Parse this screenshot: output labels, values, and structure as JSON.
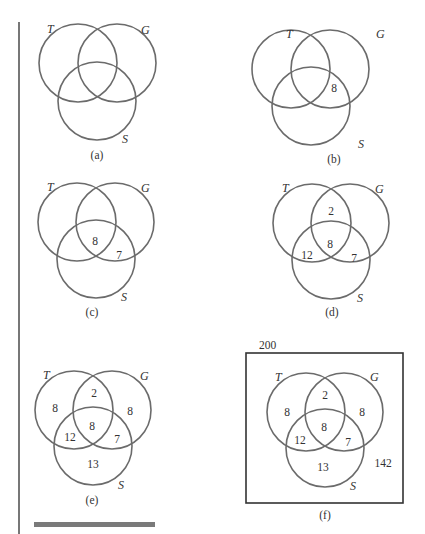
{
  "sets": {
    "T": "T",
    "G": "G",
    "S": "S"
  },
  "panels": [
    {
      "id": "a",
      "caption": "(a)",
      "regions": {}
    },
    {
      "id": "b",
      "caption": "(b)",
      "regions": {
        "TGS": "8"
      }
    },
    {
      "id": "c",
      "caption": "(c)",
      "regions": {
        "TGS": "8",
        "GS": "7"
      }
    },
    {
      "id": "d",
      "caption": "(d)",
      "regions": {
        "TG": "2",
        "TGS": "8",
        "TS": "12",
        "GS": "7"
      }
    },
    {
      "id": "e",
      "caption": "(e)",
      "regions": {
        "T": "8",
        "TG": "2",
        "G": "8",
        "TGS": "8",
        "TS": "12",
        "GS": "7",
        "S": "13"
      }
    },
    {
      "id": "f",
      "caption": "(f)",
      "universe_total": "200",
      "outside": "142",
      "regions": {
        "T": "8",
        "TG": "2",
        "G": "8",
        "TGS": "8",
        "TS": "12",
        "GS": "7",
        "S": "13"
      }
    }
  ]
}
